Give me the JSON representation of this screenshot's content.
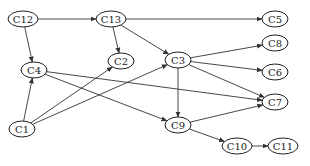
{
  "diagram": {
    "type": "directed-graph",
    "nodes": [
      {
        "id": "C12",
        "label": "C12",
        "x": 23,
        "y": 19,
        "rx": 15,
        "ry": 8
      },
      {
        "id": "C13",
        "label": "C13",
        "x": 111,
        "y": 19,
        "rx": 15,
        "ry": 8
      },
      {
        "id": "C5",
        "label": "C5",
        "x": 275,
        "y": 19,
        "rx": 13,
        "ry": 8
      },
      {
        "id": "C8",
        "label": "C8",
        "x": 275,
        "y": 43,
        "rx": 13,
        "ry": 8
      },
      {
        "id": "C2",
        "label": "C2",
        "x": 121,
        "y": 61,
        "rx": 13,
        "ry": 8
      },
      {
        "id": "C3",
        "label": "C3",
        "x": 178,
        "y": 60,
        "rx": 13,
        "ry": 8
      },
      {
        "id": "C6",
        "label": "C6",
        "x": 275,
        "y": 72,
        "rx": 13,
        "ry": 8
      },
      {
        "id": "C4",
        "label": "C4",
        "x": 34,
        "y": 70,
        "rx": 13,
        "ry": 8
      },
      {
        "id": "C7",
        "label": "C7",
        "x": 275,
        "y": 102,
        "rx": 13,
        "ry": 8
      },
      {
        "id": "C1",
        "label": "C1",
        "x": 22,
        "y": 129,
        "rx": 13,
        "ry": 8
      },
      {
        "id": "C9",
        "label": "C9",
        "x": 178,
        "y": 125,
        "rx": 13,
        "ry": 8
      },
      {
        "id": "C10",
        "label": "C10",
        "x": 237,
        "y": 146,
        "rx": 15,
        "ry": 8
      },
      {
        "id": "C11",
        "label": "C11",
        "x": 283,
        "y": 146,
        "rx": 15,
        "ry": 8
      }
    ],
    "edges": [
      {
        "from": "C12",
        "to": "C13"
      },
      {
        "from": "C12",
        "to": "C4"
      },
      {
        "from": "C13",
        "to": "C5"
      },
      {
        "from": "C13",
        "to": "C2"
      },
      {
        "from": "C13",
        "to": "C3"
      },
      {
        "from": "C3",
        "to": "C8"
      },
      {
        "from": "C3",
        "to": "C6"
      },
      {
        "from": "C3",
        "to": "C7"
      },
      {
        "from": "C3",
        "to": "C9"
      },
      {
        "from": "C4",
        "to": "C7"
      },
      {
        "from": "C4",
        "to": "C9"
      },
      {
        "from": "C1",
        "to": "C4"
      },
      {
        "from": "C1",
        "to": "C2"
      },
      {
        "from": "C1",
        "to": "C3"
      },
      {
        "from": "C9",
        "to": "C7"
      },
      {
        "from": "C9",
        "to": "C10"
      },
      {
        "from": "C10",
        "to": "C11"
      }
    ]
  }
}
